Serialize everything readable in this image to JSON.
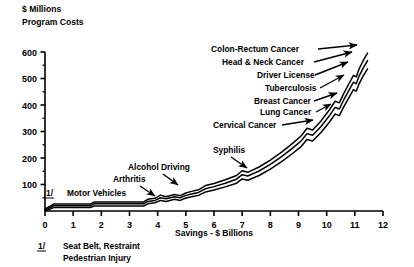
{
  "chart_data": {
    "type": "line",
    "title": "",
    "header_lines": [
      "$ Millions",
      "Program Costs"
    ],
    "ylabel": "Program Costs",
    "yunit": "$ Millions",
    "xlabel": "Savings - $ Billions",
    "xlim": [
      0,
      12
    ],
    "ylim": [
      0,
      600
    ],
    "yticks": [
      100,
      200,
      300,
      400,
      500,
      600
    ],
    "ytick_labels": [
      "100",
      "200",
      "300",
      "400",
      "500",
      "600"
    ],
    "yminor_ticks": [
      50,
      150,
      250,
      350,
      450,
      550
    ],
    "xticks": [
      0,
      1,
      2,
      3,
      4,
      5,
      6,
      7,
      8,
      9,
      10,
      11,
      12
    ],
    "xtick_labels": [
      "0",
      "1",
      "2",
      "3",
      "4",
      "5",
      "6",
      "7",
      "8",
      "9",
      "10",
      "11",
      "12"
    ],
    "grid": false,
    "legend": "none",
    "series": [
      {
        "name": "upper-bound",
        "points": [
          [
            0,
            8
          ],
          [
            0.25,
            22
          ],
          [
            0.3,
            26
          ],
          [
            1.6,
            26
          ],
          [
            1.75,
            34
          ],
          [
            3.5,
            34
          ],
          [
            3.65,
            44
          ],
          [
            3.9,
            48
          ],
          [
            4.1,
            60
          ],
          [
            4.3,
            54
          ],
          [
            4.6,
            62
          ],
          [
            4.8,
            58
          ],
          [
            5.0,
            68
          ],
          [
            5.2,
            74
          ],
          [
            5.45,
            80
          ],
          [
            5.7,
            96
          ],
          [
            6.0,
            104
          ],
          [
            6.4,
            118
          ],
          [
            6.8,
            134
          ],
          [
            7.0,
            152
          ],
          [
            7.2,
            146
          ],
          [
            7.6,
            166
          ],
          [
            8.0,
            192
          ],
          [
            8.4,
            222
          ],
          [
            8.8,
            256
          ],
          [
            9.1,
            284
          ],
          [
            9.3,
            312
          ],
          [
            9.5,
            306
          ],
          [
            9.8,
            340
          ],
          [
            10.1,
            382
          ],
          [
            10.3,
            414
          ],
          [
            10.45,
            408
          ],
          [
            10.6,
            442
          ],
          [
            10.8,
            482
          ],
          [
            10.95,
            512
          ],
          [
            11.05,
            506
          ],
          [
            11.15,
            536
          ],
          [
            11.3,
            568
          ],
          [
            11.45,
            596
          ]
        ]
      },
      {
        "name": "middle-estimate",
        "points": [
          [
            0,
            4
          ],
          [
            0.25,
            16
          ],
          [
            0.3,
            20
          ],
          [
            1.6,
            20
          ],
          [
            1.75,
            27
          ],
          [
            3.5,
            27
          ],
          [
            3.65,
            36
          ],
          [
            3.9,
            40
          ],
          [
            4.1,
            50
          ],
          [
            4.3,
            46
          ],
          [
            4.6,
            54
          ],
          [
            4.8,
            50
          ],
          [
            5.0,
            59
          ],
          [
            5.2,
            64
          ],
          [
            5.45,
            70
          ],
          [
            5.7,
            84
          ],
          [
            6.0,
            92
          ],
          [
            6.4,
            105
          ],
          [
            6.8,
            120
          ],
          [
            7.0,
            137
          ],
          [
            7.2,
            132
          ],
          [
            7.6,
            151
          ],
          [
            8.0,
            176
          ],
          [
            8.4,
            205
          ],
          [
            8.8,
            238
          ],
          [
            9.1,
            265
          ],
          [
            9.3,
            292
          ],
          [
            9.5,
            286
          ],
          [
            9.8,
            319
          ],
          [
            10.1,
            360
          ],
          [
            10.3,
            391
          ],
          [
            10.45,
            385
          ],
          [
            10.6,
            418
          ],
          [
            10.8,
            457
          ],
          [
            10.95,
            486
          ],
          [
            11.05,
            480
          ],
          [
            11.15,
            509
          ],
          [
            11.3,
            540
          ],
          [
            11.45,
            567
          ]
        ]
      },
      {
        "name": "lower-bound",
        "points": [
          [
            0,
            0
          ],
          [
            0.25,
            10
          ],
          [
            0.3,
            13
          ],
          [
            1.6,
            13
          ],
          [
            1.75,
            19
          ],
          [
            3.5,
            19
          ],
          [
            3.65,
            27
          ],
          [
            3.9,
            31
          ],
          [
            4.1,
            40
          ],
          [
            4.3,
            36
          ],
          [
            4.6,
            44
          ],
          [
            4.8,
            40
          ],
          [
            5.0,
            49
          ],
          [
            5.2,
            54
          ],
          [
            5.45,
            59
          ],
          [
            5.7,
            72
          ],
          [
            6.0,
            79
          ],
          [
            6.4,
            91
          ],
          [
            6.8,
            105
          ],
          [
            7.0,
            121
          ],
          [
            7.2,
            116
          ],
          [
            7.6,
            134
          ],
          [
            8.0,
            158
          ],
          [
            8.4,
            186
          ],
          [
            8.8,
            218
          ],
          [
            9.1,
            244
          ],
          [
            9.3,
            270
          ],
          [
            9.5,
            264
          ],
          [
            9.8,
            296
          ],
          [
            10.1,
            336
          ],
          [
            10.3,
            366
          ],
          [
            10.45,
            360
          ],
          [
            10.6,
            392
          ],
          [
            10.8,
            430
          ],
          [
            10.95,
            458
          ],
          [
            11.05,
            452
          ],
          [
            11.15,
            480
          ],
          [
            11.3,
            510
          ],
          [
            11.45,
            536
          ]
        ]
      }
    ],
    "annotations": [
      {
        "label": "Colon-Rectum Cancer",
        "text_x": 211,
        "text_y": 52,
        "anchor": "start",
        "arrow": [
          [
            318,
            49
          ],
          [
            357,
            45
          ]
        ]
      },
      {
        "label": "Head & Neck Cancer",
        "text_x": 222,
        "text_y": 65,
        "anchor": "start",
        "arrow": [
          [
            314,
            62
          ],
          [
            352,
            52
          ]
        ]
      },
      {
        "label": "Driver License",
        "text_x": 257,
        "text_y": 78,
        "anchor": "start",
        "arrow": [
          [
            315,
            75
          ],
          [
            348,
            62
          ]
        ]
      },
      {
        "label": "Tuberculosis",
        "text_x": 265,
        "text_y": 91,
        "anchor": "start",
        "arrow": [
          [
            320,
            88
          ],
          [
            344,
            75
          ]
        ]
      },
      {
        "label": "Breast Cancer",
        "text_x": 254,
        "text_y": 104,
        "anchor": "start",
        "arrow": [
          [
            314,
            101
          ],
          [
            337,
            93
          ]
        ]
      },
      {
        "label": "Lung Cancer",
        "text_x": 260,
        "text_y": 115,
        "anchor": "start",
        "arrow": [
          [
            316,
            112
          ],
          [
            331,
            104
          ]
        ]
      },
      {
        "label": "Cervical Cancer",
        "text_x": 213,
        "text_y": 128,
        "anchor": "start",
        "arrow": [
          [
            282,
            125
          ],
          [
            313,
            120
          ]
        ]
      },
      {
        "label": "Syphilis",
        "text_x": 213,
        "text_y": 153,
        "anchor": "start",
        "arrow": [
          [
            231,
            157
          ],
          [
            247,
            168
          ]
        ]
      },
      {
        "label": "Alcohol Driving",
        "text_x": 128,
        "text_y": 170,
        "anchor": "start",
        "arrow": [
          [
            163,
            174
          ],
          [
            178,
            185
          ]
        ]
      },
      {
        "label": "Arthritis",
        "text_x": 113,
        "text_y": 182,
        "anchor": "start",
        "arrow": [
          [
            140,
            186
          ],
          [
            155,
            196
          ]
        ]
      },
      {
        "label": "Motor Vehicles",
        "text_x": 67,
        "text_y": 196,
        "anchor": "start",
        "arrow": []
      }
    ],
    "curve_marker": "1/",
    "curve_marker_pos": {
      "x": 46,
      "y": 196
    },
    "footnote": {
      "marker": "1/",
      "lines": [
        "Seat Belt, Restraint",
        "Pedestrian Injury"
      ]
    }
  }
}
